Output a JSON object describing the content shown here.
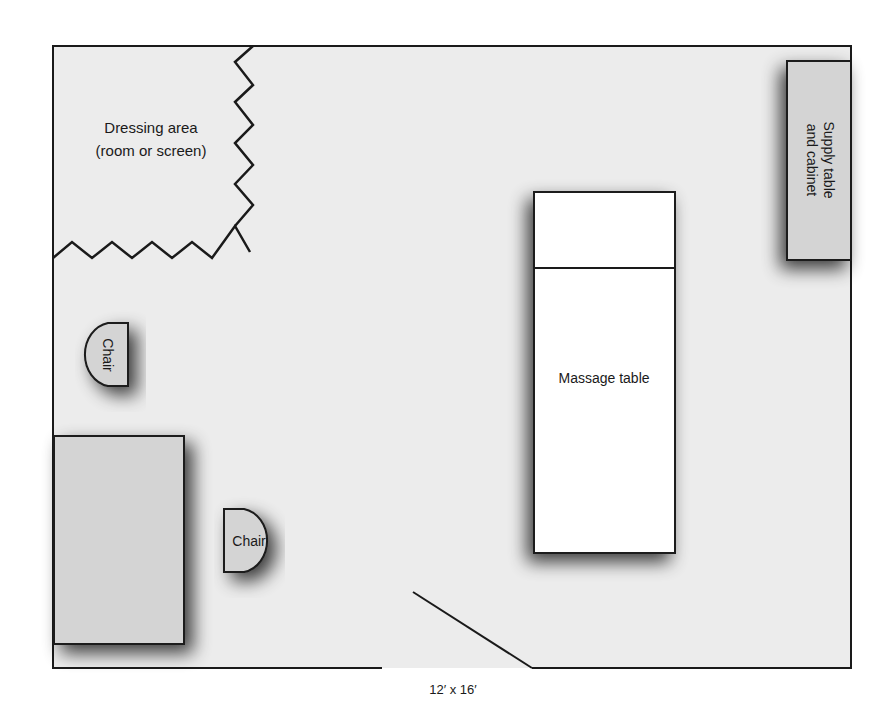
{
  "diagram": {
    "type": "floor-plan",
    "dimensions_label": "12′ x 16′",
    "colors": {
      "room_fill": "#ececec",
      "furniture_fill": "#d4d4d4",
      "table_fill": "#ffffff",
      "line": "#1a1a1a"
    },
    "labels": {
      "dressing_area_line1": "Dressing area",
      "dressing_area_line2": "(room or screen)",
      "supply_line1": "Supply table",
      "supply_line2": "and cabinet",
      "massage_table": "Massage table",
      "chair_1": "Chair",
      "chair_2": "Chair"
    }
  }
}
